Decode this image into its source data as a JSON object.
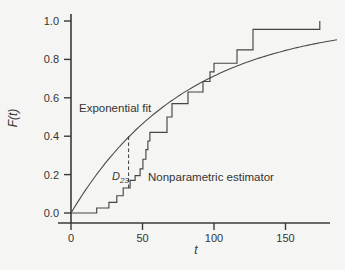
{
  "figure": {
    "background_color": "#f5f5f3",
    "ink_color": "#3a3a3a"
  },
  "chart_data": {
    "type": "line",
    "title": "",
    "xlabel": "t",
    "ylabel": "F(t)",
    "xlim": [
      0,
      181
    ],
    "ylim": [
      0,
      1.0
    ],
    "x_ticks": [
      0,
      50,
      100,
      150
    ],
    "y_ticks": [
      "0.0",
      "0.2",
      "0.4",
      "0.6",
      "0.8",
      "1.0"
    ],
    "grid": "off",
    "legend": "none (inline text annotations)",
    "series": [
      {
        "name": "Exponential fit",
        "type": "smooth-curve",
        "model": "F(t) = 1 - exp(-t/beta)",
        "beta": 80,
        "t_start": 0,
        "t_end": 187
      },
      {
        "name": "Nonparametric estimator",
        "type": "step",
        "start": [
          0,
          0.0
        ],
        "jumps": [
          [
            18,
            0.026
          ],
          [
            26.5,
            0.055
          ],
          [
            32,
            0.09
          ],
          [
            36.5,
            0.13
          ],
          [
            41.3,
            0.17
          ],
          [
            44.8,
            0.195
          ],
          [
            48.3,
            0.23
          ],
          [
            50.3,
            0.28
          ],
          [
            52.4,
            0.33
          ],
          [
            53.8,
            0.375
          ],
          [
            55.2,
            0.42
          ],
          [
            67.1,
            0.5
          ],
          [
            70.6,
            0.57
          ],
          [
            81.8,
            0.63
          ],
          [
            92.3,
            0.685
          ],
          [
            97.2,
            0.735
          ],
          [
            100,
            0.78
          ],
          [
            116.1,
            0.85
          ],
          [
            127.3,
            0.957
          ],
          [
            174,
            1.0
          ]
        ]
      }
    ],
    "annotations": {
      "exponential_label": "Exponential fit",
      "nonparametric_label": "Nonparametric estimator",
      "d_statistic": {
        "base": "D",
        "sub": "23",
        "t": 40.3,
        "f_from": 0.13,
        "f_to": 0.4,
        "line_style": "dashed"
      }
    }
  }
}
